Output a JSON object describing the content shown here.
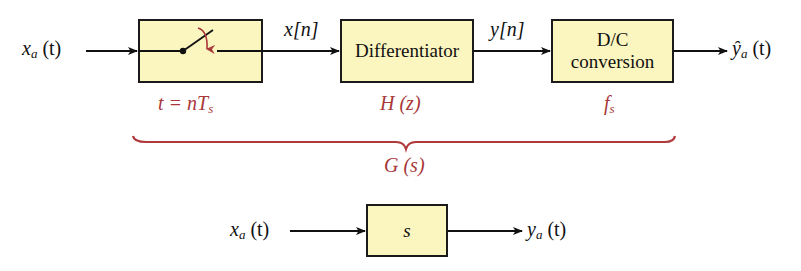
{
  "diagram": {
    "type": "block-diagram",
    "colors": {
      "box_fill": "#fbf5bf",
      "box_border": "#1a1a1a",
      "annotation": "#a8383a",
      "wire": "#111111"
    },
    "top_chain": {
      "input_label": {
        "main": "x",
        "sub": "a",
        "arg": "(t)"
      },
      "blocks": [
        {
          "id": "sampler",
          "label": "",
          "icon": "switch-icon",
          "annotation": {
            "main": "t = nT",
            "sub": "s"
          }
        },
        {
          "id": "differentiator",
          "label": "Differentiator",
          "annotation": {
            "main": "H (z)"
          }
        },
        {
          "id": "dc-converter",
          "label_line1": "D/C",
          "label_line2": "conversion",
          "annotation": {
            "main": "f",
            "sub": "s"
          }
        }
      ],
      "signals": [
        {
          "between": [
            "sampler",
            "differentiator"
          ],
          "label": "x[n]"
        },
        {
          "between": [
            "differentiator",
            "dc-converter"
          ],
          "label": "y[n]"
        }
      ],
      "output_label": {
        "main": "ŷ",
        "sub": "a",
        "arg": "(t)"
      },
      "brace_label": "G (s)"
    },
    "bottom_chain": {
      "input_label": {
        "main": "x",
        "sub": "a",
        "arg": "(t)"
      },
      "block_label": "s",
      "output_label": {
        "main": "y",
        "sub": "a",
        "arg": "(t)"
      }
    }
  }
}
